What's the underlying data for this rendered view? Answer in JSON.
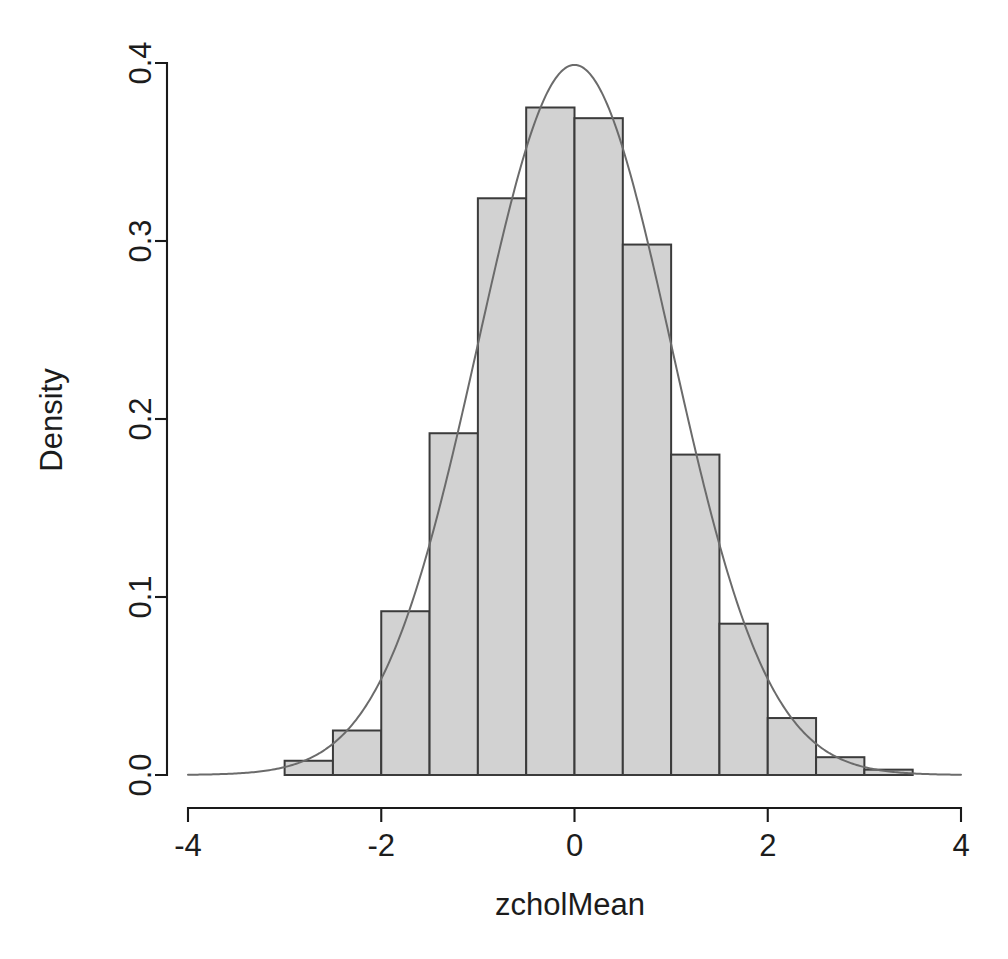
{
  "chart_data": {
    "type": "bar",
    "title": "",
    "subtitle": "",
    "xlabel": "zcholMean",
    "ylabel": "Density",
    "xlim": [
      -4,
      4
    ],
    "ylim": [
      0.0,
      0.4
    ],
    "grid": false,
    "legend": null,
    "xticks": [
      "-4",
      "-2",
      "0",
      "2",
      "4"
    ],
    "xtick_values": [
      -4,
      -2,
      0,
      2,
      4
    ],
    "yticks": [
      "0.0",
      "0.1",
      "0.2",
      "0.3",
      "0.4"
    ],
    "ytick_values": [
      0.0,
      0.1,
      0.2,
      0.3,
      0.4
    ],
    "bin_width": 0.5,
    "bin_edges": [
      -3.0,
      -2.5,
      -2.0,
      -1.5,
      -1.0,
      -0.5,
      0.0,
      0.5,
      1.0,
      1.5,
      2.0,
      2.5,
      3.0,
      3.5
    ],
    "categories": [
      "[-3.0,-2.5)",
      "[-2.5,-2.0)",
      "[-2.0,-1.5)",
      "[-1.5,-1.0)",
      "[-1.0,-0.5)",
      "[-0.5,0.0)",
      "[0.0,0.5)",
      "[0.5,1.0)",
      "[1.0,1.5)",
      "[1.5,2.0)",
      "[2.0,2.5)",
      "[2.5,3.0)",
      "[3.0,3.5)"
    ],
    "values": [
      0.008,
      0.025,
      0.092,
      0.192,
      0.324,
      0.375,
      0.369,
      0.298,
      0.18,
      0.085,
      0.032,
      0.01,
      0.003
    ],
    "series": [
      {
        "name": "Histogram density",
        "type": "bar",
        "values": [
          0.008,
          0.025,
          0.092,
          0.192,
          0.324,
          0.375,
          0.369,
          0.298,
          0.18,
          0.085,
          0.032,
          0.01,
          0.003
        ]
      },
      {
        "name": "Normal density curve",
        "type": "line",
        "mean": 0,
        "sd": 1,
        "peak": 0.3989,
        "x_range": [
          -4,
          4
        ]
      }
    ],
    "bar_fill": "#d2d2d2",
    "bar_border": "#3b3b3b",
    "curve_color": "#6b6b6b"
  },
  "axes": {
    "x_title": "zcholMean",
    "y_title": "Density"
  }
}
